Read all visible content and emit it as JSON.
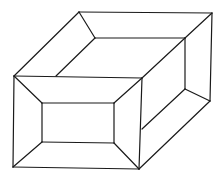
{
  "figure": {
    "stroke_color": "#1a1a1a",
    "background": "#ffffff",
    "lines": [
      {
        "id": "back-top-edge",
        "x1": 79,
        "y1": 12,
        "x2": 212,
        "y2": 13
      },
      {
        "id": "left-top-diagonal",
        "x1": 79,
        "y1": 12,
        "x2": 14,
        "y2": 76
      },
      {
        "id": "right-outer-vertical",
        "x1": 212,
        "y1": 13,
        "x2": 210,
        "y2": 101
      },
      {
        "id": "top-corner-to-inner",
        "x1": 79,
        "y1": 12,
        "x2": 95,
        "y2": 38
      },
      {
        "id": "inner-top-edge",
        "x1": 95,
        "y1": 38,
        "x2": 185,
        "y2": 38
      },
      {
        "id": "inner-left-diagonal",
        "x1": 95,
        "y1": 38,
        "x2": 56,
        "y2": 76
      },
      {
        "id": "top-right-to-inner",
        "x1": 212,
        "y1": 13,
        "x2": 185,
        "y2": 38
      },
      {
        "id": "inner-right-diagonal",
        "x1": 185,
        "y1": 38,
        "x2": 142,
        "y2": 78
      },
      {
        "id": "inner-right-vertical",
        "x1": 185,
        "y1": 38,
        "x2": 185,
        "y2": 89
      },
      {
        "id": "inner-bottom-right-to-outer",
        "x1": 185,
        "y1": 89,
        "x2": 210,
        "y2": 101
      },
      {
        "id": "inner-bottom-diagonal",
        "x1": 185,
        "y1": 89,
        "x2": 142,
        "y2": 129
      },
      {
        "id": "outer-bottom-diagonal",
        "x1": 210,
        "y1": 101,
        "x2": 139,
        "y2": 169
      },
      {
        "id": "front-outer-top",
        "x1": 14,
        "y1": 76,
        "x2": 142,
        "y2": 78
      },
      {
        "id": "front-outer-right",
        "x1": 142,
        "y1": 78,
        "x2": 139,
        "y2": 169
      },
      {
        "id": "front-outer-bottom",
        "x1": 139,
        "y1": 169,
        "x2": 13,
        "y2": 167
      },
      {
        "id": "front-outer-left",
        "x1": 13,
        "y1": 167,
        "x2": 14,
        "y2": 76
      },
      {
        "id": "front-inner-top",
        "x1": 42,
        "y1": 103,
        "x2": 114,
        "y2": 103
      },
      {
        "id": "front-inner-right",
        "x1": 114,
        "y1": 103,
        "x2": 114,
        "y2": 143
      },
      {
        "id": "front-inner-bottom",
        "x1": 114,
        "y1": 143,
        "x2": 42,
        "y2": 142
      },
      {
        "id": "front-inner-left",
        "x1": 42,
        "y1": 142,
        "x2": 42,
        "y2": 103
      },
      {
        "id": "bevel-top-left",
        "x1": 14,
        "y1": 76,
        "x2": 42,
        "y2": 103
      },
      {
        "id": "bevel-top-right",
        "x1": 142,
        "y1": 78,
        "x2": 114,
        "y2": 103
      },
      {
        "id": "bevel-bottom-right",
        "x1": 139,
        "y1": 169,
        "x2": 114,
        "y2": 143
      },
      {
        "id": "bevel-bottom-left",
        "x1": 13,
        "y1": 167,
        "x2": 42,
        "y2": 142
      }
    ]
  }
}
